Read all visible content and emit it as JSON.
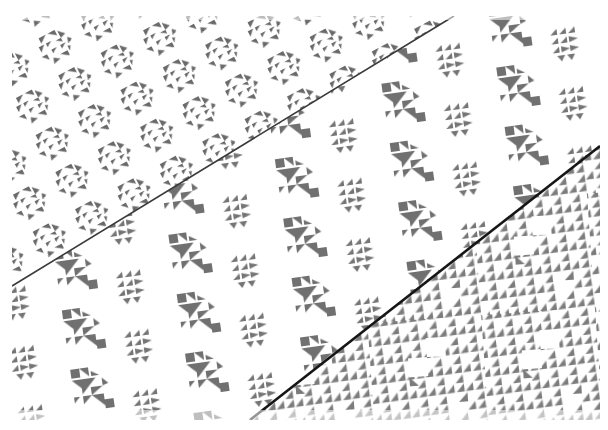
{
  "image": {
    "subject": "Three overlapping sheets of patterned paper with grey geometric quilt-block designs",
    "width": 608,
    "height": 430,
    "background_color": "#ffffff",
    "ink_color": "#6f6f6f",
    "seam_color": "#1a1a1a",
    "content_bounds": {
      "left": 12,
      "top": 16,
      "right": 600,
      "bottom": 420
    }
  },
  "sheets": [
    {
      "name": "top-left-sheet",
      "pattern": "hexagonal lattice of triangle blocks",
      "region_polygon": [
        [
          12,
          16
        ],
        [
          454,
          16
        ],
        [
          12,
          286
        ]
      ],
      "tile_size": 48,
      "rotation_deg": -28
    },
    {
      "name": "middle-sheet",
      "pattern": "alternating star blocks and flying-geese blocks",
      "region_polygon": [
        [
          454,
          16
        ],
        [
          600,
          16
        ],
        [
          600,
          146
        ],
        [
          250,
          420
        ],
        [
          12,
          420
        ],
        [
          12,
          286
        ]
      ],
      "tile_size": 58,
      "rotation_deg": -8
    },
    {
      "name": "bottom-right-sheet",
      "pattern": "dense grid of half-square triangles",
      "region_polygon": [
        [
          600,
          146
        ],
        [
          600,
          420
        ],
        [
          250,
          420
        ]
      ],
      "tile_size": 19,
      "rotation_deg": -4
    }
  ],
  "seams": [
    {
      "name": "seam-upper",
      "x1": 454,
      "y1": 16,
      "x2": 12,
      "y2": 286,
      "width": 2
    },
    {
      "name": "seam-lower",
      "x1": 600,
      "y1": 146,
      "x2": 250,
      "y2": 420,
      "width": 3
    }
  ],
  "caption": "Patterned paper sheets with grey geometric triangle motifs"
}
